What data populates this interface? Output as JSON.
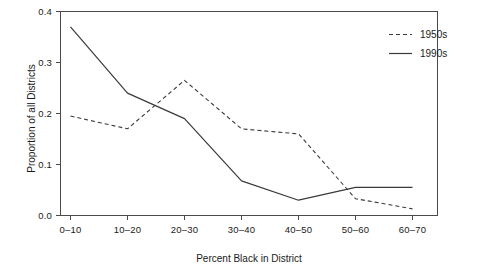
{
  "chart_data": {
    "type": "line",
    "title": "",
    "xlabel": "Percent Black in District",
    "ylabel": "Proportion of all Districts",
    "categories": [
      "0–10",
      "10–20",
      "20–30",
      "30–40",
      "40–50",
      "50–60",
      "60–70"
    ],
    "series": [
      {
        "name": "1950s",
        "style": "dashed",
        "color": "#3a3a3a",
        "values": [
          0.195,
          0.17,
          0.265,
          0.17,
          0.16,
          0.033,
          0.013
        ]
      },
      {
        "name": "1990s",
        "style": "solid",
        "color": "#3a3a3a",
        "values": [
          0.37,
          0.24,
          0.19,
          0.068,
          0.03,
          0.055,
          0.055
        ]
      }
    ],
    "ylim": [
      0.0,
      0.4
    ],
    "yticks": [
      0.0,
      0.1,
      0.2,
      0.3,
      0.4
    ],
    "ytick_labels": [
      "0.0",
      "0.1",
      "0.2",
      "0.3",
      "0.4"
    ],
    "grid": false,
    "legend_position": "top-right"
  },
  "legend": {
    "items": [
      {
        "label": "1950s",
        "style": "dashed"
      },
      {
        "label": "1990s",
        "style": "solid"
      }
    ]
  },
  "axes": {
    "y_title": "Proportion of all Districts",
    "x_title": "Percent Black in District",
    "y_tick_labels": [
      "0.4",
      "0.3",
      "0.2",
      "0.1",
      "0.0"
    ],
    "x_tick_labels": [
      "0–10",
      "10–20",
      "20–30",
      "30–40",
      "40–50",
      "50–60",
      "60–70"
    ]
  },
  "colors": {
    "line": "#3a3a3a",
    "axis": "#4a4a4a",
    "text": "#1a1a1a",
    "background": "#ffffff"
  }
}
